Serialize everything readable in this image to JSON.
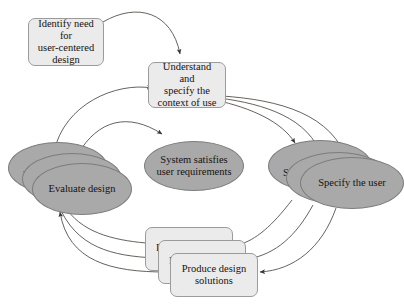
{
  "diagram": {
    "colors": {
      "background": "#ffffff",
      "box_fill": "#ebebeb",
      "box_stroke": "#9b9b9b",
      "ellipse_fill": "#a9a9a9",
      "ellipse_stroke": "#7d7d7d",
      "edge_stroke": "#55504c",
      "text": "#16120f"
    },
    "nodes": {
      "identify_need": {
        "label": "Identify need for\nuser-centered\ndesign",
        "shape": "rounded-rectangle"
      },
      "understand_context": {
        "label": "Understand and\nspecify the\ncontext of use",
        "shape": "rounded-rectangle"
      },
      "system_satisfies": {
        "label": "System satisfies\nuser requirements",
        "shape": "ellipse"
      },
      "specify_user": {
        "label": "Specify the user",
        "shape": "ellipse-stack",
        "stack_fragments": [
          "Sp",
          "Sp"
        ]
      },
      "evaluate_design": {
        "label": "Evaluate design",
        "shape": "ellipse-stack",
        "stack_fragments": [
          "Ev",
          "Ev"
        ]
      },
      "produce_design": {
        "label": "Produce design\nsolutions",
        "shape": "rounded-rectangle-stack",
        "stack_fragments": [
          "P",
          "P"
        ]
      }
    },
    "edges": [
      {
        "name": "identify-need-to-understand-context",
        "from": "identify_need",
        "to": "understand_context",
        "arrowhead": true
      },
      {
        "name": "understand-context-to-specify-user-1",
        "from": "understand_context",
        "to": "specify_user",
        "arrowhead": true
      },
      {
        "name": "understand-context-to-specify-user-2",
        "from": "understand_context",
        "to": "specify_user",
        "arrowhead": true
      },
      {
        "name": "understand-context-to-specify-user-3",
        "from": "understand_context",
        "to": "specify_user",
        "arrowhead": true
      },
      {
        "name": "specify-user-to-produce-design-1",
        "from": "specify_user",
        "to": "produce_design",
        "arrowhead": false
      },
      {
        "name": "specify-user-to-produce-design-2",
        "from": "specify_user",
        "to": "produce_design",
        "arrowhead": false
      },
      {
        "name": "specify-user-to-produce-design-3",
        "from": "specify_user",
        "to": "produce_design",
        "arrowhead": true
      },
      {
        "name": "produce-design-to-evaluate-design-1",
        "from": "produce_design",
        "to": "evaluate_design",
        "arrowhead": false
      },
      {
        "name": "produce-design-to-evaluate-design-2",
        "from": "produce_design",
        "to": "evaluate_design",
        "arrowhead": false
      },
      {
        "name": "produce-design-to-evaluate-design-3",
        "from": "produce_design",
        "to": "evaluate_design",
        "arrowhead": true
      },
      {
        "name": "evaluate-design-to-understand-context",
        "from": "evaluate_design",
        "to": "understand_context",
        "arrowhead": true
      },
      {
        "name": "evaluate-design-to-system-satisfies",
        "from": "evaluate_design",
        "to": "system_satisfies",
        "arrowhead": true
      }
    ]
  }
}
